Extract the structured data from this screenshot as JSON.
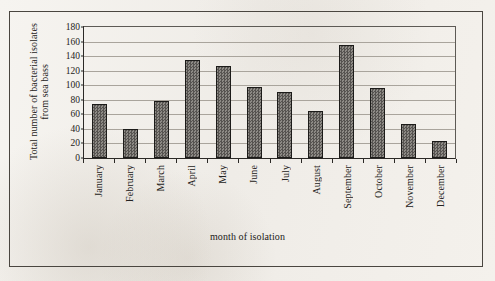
{
  "chart_data": {
    "type": "bar",
    "title": "",
    "xlabel": "month of isolation",
    "ylabel": "Total number of bacterial isolates from sea bass",
    "ylabel_lines": [
      "Total number of bacterial isolates",
      "from sea bass"
    ],
    "categories": [
      "January",
      "February",
      "March",
      "April",
      "May",
      "June",
      "July",
      "August",
      "September",
      "October",
      "November",
      "December"
    ],
    "values": [
      74,
      40,
      79,
      134,
      127,
      98,
      91,
      64,
      155,
      96,
      47,
      24
    ],
    "ylim": [
      0,
      180
    ],
    "ytick_step": 20,
    "yticks": [
      0,
      20,
      40,
      60,
      80,
      100,
      120,
      140,
      160,
      180
    ],
    "grid": true,
    "grid_axis": "y",
    "legend": false,
    "bar_fill_color": "#6e6b66",
    "bar_edge_color": "#1c1b19",
    "axis_color": "#2b2926",
    "grid_color": "#a9a49c",
    "background_color": "#f2f0ec",
    "series": [
      {
        "name": "Total number of bacterial isolates from sea bass",
        "values": [
          74,
          40,
          79,
          134,
          127,
          98,
          91,
          64,
          155,
          96,
          47,
          24
        ]
      }
    ]
  }
}
